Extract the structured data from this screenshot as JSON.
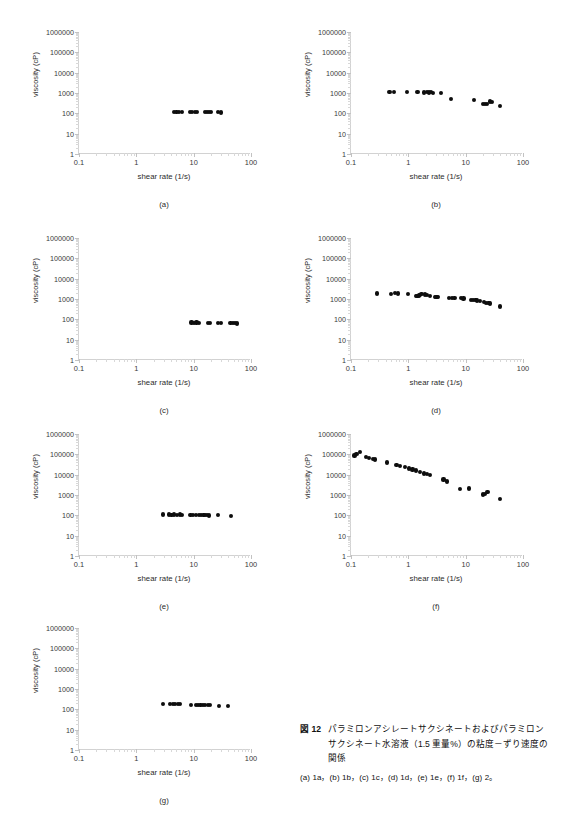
{
  "figure": {
    "id": "figure-12",
    "caption_tag": "図 12",
    "caption_text": "パラミロンアシレートサクシネートおよびパラミロンサクシネート水溶液（1.5 重量%）の粘度－ずり速度の関係",
    "caption_sub": "(a) 1a，(b) 1b，(c) 1c，(d) 1d，(e) 1e，(f) 1f，(g) 2。"
  },
  "axis_common": {
    "xlabel": "shear rate (1/s)",
    "ylabel": "viscosity (cP)",
    "xticks": [
      "0.1",
      "1",
      "10",
      "100"
    ],
    "yticks": [
      "1000000",
      "100000",
      "10000",
      "1000",
      "100",
      "10",
      "1"
    ],
    "xlim": [
      0.1,
      100
    ],
    "ylim": [
      1,
      1000000
    ],
    "xscale": "log",
    "yscale": "log",
    "grid": false,
    "marker_color": "#0d0d0d",
    "axis_color": "#d2d2d2"
  },
  "chart_data": [
    {
      "type": "scatter",
      "panel": "(a)",
      "sample": "1a",
      "title": "",
      "xlabel": "shear rate (1/s)",
      "ylabel": "viscosity (cP)",
      "xscale": "log",
      "yscale": "log",
      "xlim": [
        0.1,
        100
      ],
      "ylim": [
        1,
        1000000
      ],
      "x": [
        4.6,
        5.0,
        5.6,
        6.2,
        8.6,
        9.5,
        10.4,
        11.5,
        15.6,
        17.0,
        18.5,
        20.2,
        27.0,
        29.5
      ],
      "y": [
        120,
        118,
        120,
        117,
        118,
        116,
        118,
        115,
        115,
        113,
        115,
        112,
        112,
        110
      ]
    },
    {
      "type": "scatter",
      "panel": "(b)",
      "sample": "1b",
      "title": "",
      "xlabel": "shear rate (1/s)",
      "ylabel": "viscosity (cP)",
      "xscale": "log",
      "yscale": "log",
      "xlim": [
        0.1,
        100
      ],
      "ylim": [
        1,
        1000000
      ],
      "x": [
        0.47,
        0.56,
        0.95,
        1.45,
        1.85,
        2.1,
        2.3,
        2.5,
        2.7,
        3.7,
        5.6,
        14.0,
        20.0,
        21.5,
        23.5,
        27.0,
        29.0,
        40.0
      ],
      "y": [
        1100,
        1150,
        1120,
        1080,
        1060,
        1080,
        1060,
        1080,
        1040,
        1030,
        520,
        470,
        300,
        290,
        300,
        380,
        360,
        240
      ]
    },
    {
      "type": "scatter",
      "panel": "(c)",
      "sample": "1c",
      "title": "",
      "xlabel": "shear rate (1/s)",
      "ylabel": "viscosity (cP)",
      "xscale": "log",
      "yscale": "log",
      "xlim": [
        0.1,
        100
      ],
      "ylim": [
        1,
        1000000
      ],
      "x": [
        9.2,
        10.2,
        11.2,
        12.2,
        17.5,
        19.0,
        27.0,
        29.5,
        44.0,
        48.0,
        52.0,
        57.0
      ],
      "y": [
        70,
        69,
        70,
        68,
        68,
        67,
        67,
        66,
        65,
        64,
        65,
        63
      ]
    },
    {
      "type": "scatter",
      "panel": "(d)",
      "sample": "1d",
      "title": "",
      "xlabel": "shear rate (1/s)",
      "ylabel": "viscosity (cP)",
      "xscale": "log",
      "yscale": "log",
      "xlim": [
        0.1,
        100
      ],
      "ylim": [
        1,
        1000000
      ],
      "x": [
        0.28,
        0.5,
        0.58,
        0.66,
        1.0,
        1.35,
        1.45,
        1.55,
        1.62,
        1.7,
        1.95,
        2.15,
        2.35,
        2.9,
        3.1,
        3.3,
        5.2,
        5.8,
        6.4,
        8.3,
        9.2,
        12.5,
        13.5,
        14.8,
        16.0,
        17.5,
        21.0,
        23.0,
        25.0,
        27.0,
        40.0
      ],
      "y": [
        1850,
        1800,
        1900,
        1850,
        1800,
        1350,
        1450,
        1500,
        1600,
        1700,
        1650,
        1600,
        1400,
        1250,
        1300,
        1200,
        1100,
        1150,
        1100,
        1100,
        1050,
        900,
        880,
        900,
        850,
        830,
        680,
        650,
        620,
        600,
        430
      ]
    },
    {
      "type": "scatter",
      "panel": "(e)",
      "sample": "1e",
      "title": "",
      "xlabel": "shear rate (1/s)",
      "ylabel": "viscosity (cP)",
      "xscale": "log",
      "yscale": "log",
      "xlim": [
        0.1,
        100
      ],
      "ylim": [
        1,
        1000000
      ],
      "x": [
        2.9,
        3.7,
        4.1,
        4.5,
        5.2,
        5.7,
        6.2,
        8.8,
        9.6,
        11.0,
        12.5,
        13.5,
        14.8,
        16.0,
        17.3,
        18.5,
        27.0,
        45.0
      ],
      "y": [
        110,
        110,
        108,
        110,
        108,
        110,
        108,
        105,
        103,
        105,
        102,
        103,
        100,
        102,
        100,
        98,
        100,
        95
      ]
    },
    {
      "type": "scatter",
      "panel": "(f)",
      "sample": "1f",
      "title": "",
      "xlabel": "shear rate (1/s)",
      "ylabel": "viscosity (cP)",
      "xscale": "log",
      "yscale": "log",
      "xlim": [
        0.1,
        100
      ],
      "ylim": [
        1,
        1000000
      ],
      "x": [
        0.115,
        0.125,
        0.145,
        0.185,
        0.205,
        0.245,
        0.26,
        0.42,
        0.62,
        0.72,
        0.88,
        1.02,
        1.18,
        1.35,
        1.6,
        1.85,
        2.1,
        2.4,
        4.1,
        4.8,
        8.0,
        11.5,
        20.0,
        22.0,
        24.0,
        40.0
      ],
      "y": [
        88000,
        100000,
        125000,
        72000,
        66000,
        60000,
        56000,
        40000,
        29000,
        27000,
        23000,
        20000,
        18000,
        16000,
        13500,
        11500,
        10500,
        9200,
        5800,
        4600,
        2000,
        2100,
        1050,
        1150,
        1350,
        620
      ]
    },
    {
      "type": "scatter",
      "panel": "(g)",
      "sample": "2",
      "title": "",
      "xlabel": "shear rate (1/s)",
      "ylabel": "viscosity (cP)",
      "xscale": "log",
      "yscale": "log",
      "xlim": [
        0.1,
        100
      ],
      "ylim": [
        1,
        1000000
      ],
      "x": [
        2.9,
        3.9,
        4.3,
        4.8,
        5.3,
        5.8,
        9.0,
        11.0,
        12.0,
        13.2,
        14.5,
        16.0,
        17.5,
        19.0,
        28.0,
        40.0
      ],
      "y": [
        185,
        180,
        178,
        180,
        176,
        178,
        170,
        168,
        170,
        166,
        168,
        164,
        160,
        162,
        150,
        145
      ]
    }
  ],
  "panel_layout": [
    {
      "key": "a",
      "left": 18,
      "top": 22
    },
    {
      "key": "b",
      "left": 290,
      "top": 22
    },
    {
      "key": "c",
      "left": 18,
      "top": 228
    },
    {
      "key": "d",
      "left": 290,
      "top": 228
    },
    {
      "key": "e",
      "left": 18,
      "top": 424
    },
    {
      "key": "f",
      "left": 290,
      "top": 424
    },
    {
      "key": "g",
      "left": 18,
      "top": 618
    }
  ]
}
